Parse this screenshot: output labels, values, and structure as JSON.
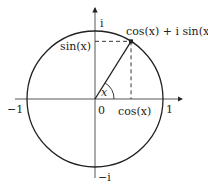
{
  "diagram": {
    "angle_label": "x",
    "point_label": "cos(x) + i sin(x)",
    "sin_label": "sin(x)",
    "cos_label": "cos(x)",
    "origin_label": "0",
    "axis_labels": {
      "pos_real": "1",
      "neg_real": "−1",
      "pos_imag": "i",
      "neg_imag": "−i"
    },
    "angle_degrees": 58,
    "colors": {
      "stroke": "#222222",
      "background": "#ffffff"
    }
  }
}
